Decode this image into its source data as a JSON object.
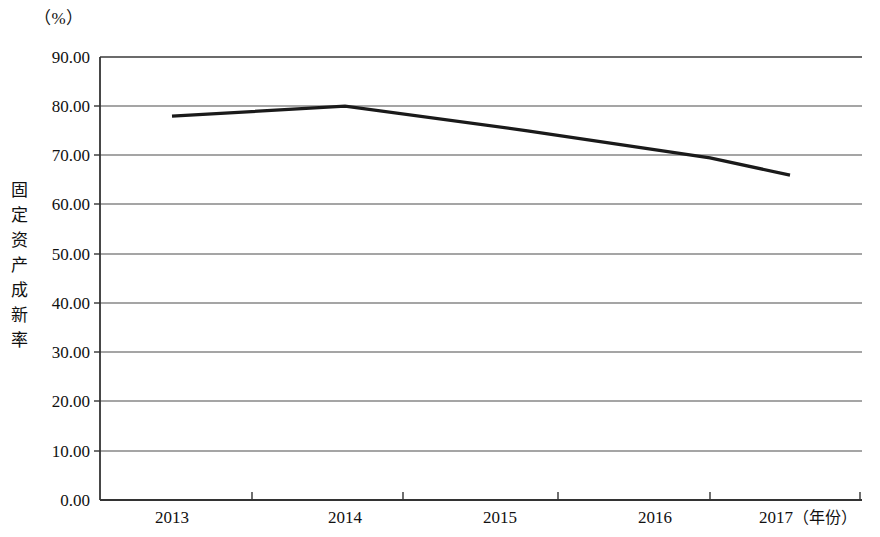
{
  "chart_data": {
    "type": "line",
    "title": "",
    "subtitle": "",
    "unit_label": "（%）",
    "xlabel": "（年份）",
    "ylabel": "固定资产成新率",
    "ylabel_chars": [
      "固",
      "定",
      "资",
      "产",
      "成",
      "新",
      "率"
    ],
    "categories": [
      "2013",
      "2014",
      "2015",
      "2016",
      "2017"
    ],
    "x": [
      2013,
      2014,
      2015,
      2016,
      2017
    ],
    "values": [
      78.0,
      80.0,
      75.0,
      69.5,
      66.0
    ],
    "series": [
      {
        "name": "固定资产成新率",
        "values": [
          78.0,
          80.0,
          75.0,
          69.5,
          66.0
        ]
      }
    ],
    "ylim": [
      0.0,
      90.0
    ],
    "ytick_labels": [
      "90.00",
      "80.00",
      "70.00",
      "60.00",
      "50.00",
      "40.00",
      "30.00",
      "20.00",
      "10.00",
      "0.00"
    ],
    "ytick_values": [
      90.0,
      80.0,
      70.0,
      60.0,
      50.0,
      40.0,
      30.0,
      20.0,
      10.0,
      0.0
    ],
    "grid": true,
    "grid_axis": "y",
    "legend": false,
    "legend_position": "none",
    "line_color": "#1a1a1a",
    "grid_color": "#4d4d4d",
    "axis_color": "#333333",
    "background_color": "#ffffff",
    "markers": false,
    "annotations": []
  },
  "layout": {
    "plot_left_px": 100,
    "plot_right_px": 862,
    "plot_top_px": 57,
    "plot_bottom_px": 500,
    "line_start_x_px": 172,
    "line_end_x_px": 790,
    "x_tick_px": [
      252,
      403,
      558,
      710,
      860
    ],
    "x_label_px": [
      172,
      345,
      500,
      655,
      800
    ]
  }
}
